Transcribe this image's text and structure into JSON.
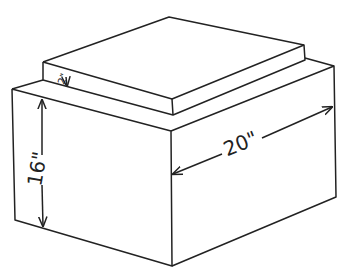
{
  "figure": {
    "stroke_color": "#222222",
    "background": "#ffffff",
    "labels": {
      "height": "16\"",
      "width": "20\"",
      "slab_thickness": "2\""
    }
  }
}
